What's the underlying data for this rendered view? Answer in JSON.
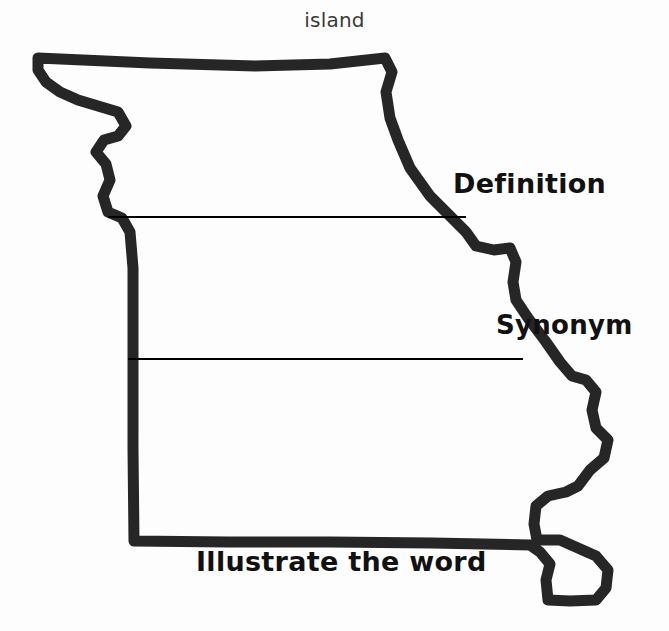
{
  "worksheet": {
    "title_word": "island",
    "shape_name": "missouri-state-outline",
    "outline_color": "#262626",
    "background_color": "#fdfdfd",
    "divider_color": "#000000",
    "sections": [
      {
        "id": "definition",
        "label": "Definition"
      },
      {
        "id": "synonym",
        "label": "Synonym"
      },
      {
        "id": "illustrate",
        "label": "Illustrate the word"
      }
    ],
    "dividers": [
      {
        "id": "divider-definition",
        "x1": 108,
        "y1": 217,
        "x2": 466,
        "y2": 217
      },
      {
        "id": "divider-synonym",
        "x1": 128,
        "y1": 359,
        "x2": 523,
        "y2": 359
      }
    ]
  }
}
